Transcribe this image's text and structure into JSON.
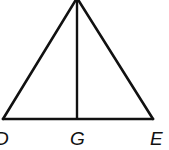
{
  "diagram": {
    "type": "isosceles-triangle-with-altitude",
    "stroke_color": "#111111",
    "background": "#ffffff",
    "vertices": {
      "apex": {
        "x": 77,
        "y": 0
      },
      "D": {
        "x": 3,
        "y": 119
      },
      "E": {
        "x": 153,
        "y": 119
      },
      "G": {
        "x": 77,
        "y": 119
      }
    },
    "labels": {
      "D": "D",
      "G": "G",
      "E": "E"
    }
  }
}
